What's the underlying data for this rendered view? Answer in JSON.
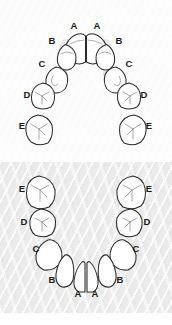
{
  "figure": {
    "panels": [
      {
        "id": "upper",
        "name": "maxillary-arch",
        "background_color": "#fdfdfd"
      },
      {
        "id": "lower",
        "name": "mandibular-arch",
        "background_color": "#ebebeb"
      }
    ],
    "tooth_outline_color": "#2a2a2a",
    "label_color": "#1b1b1b"
  },
  "upper_arch": {
    "labels": [
      {
        "text": "A",
        "x": 74,
        "y": 26
      },
      {
        "text": "A",
        "x": 97,
        "y": 26
      },
      {
        "text": "B",
        "x": 52,
        "y": 41
      },
      {
        "text": "B",
        "x": 119,
        "y": 41
      },
      {
        "text": "C",
        "x": 42,
        "y": 64
      },
      {
        "text": "C",
        "x": 129,
        "y": 64
      },
      {
        "text": "D",
        "x": 27,
        "y": 95
      },
      {
        "text": "D",
        "x": 144,
        "y": 95
      },
      {
        "text": "E",
        "x": 22,
        "y": 126
      },
      {
        "text": "E",
        "x": 149,
        "y": 126
      }
    ]
  },
  "lower_arch": {
    "labels": [
      {
        "text": "E",
        "x": 22,
        "y": 189
      },
      {
        "text": "E",
        "x": 149,
        "y": 189
      },
      {
        "text": "D",
        "x": 24,
        "y": 222
      },
      {
        "text": "D",
        "x": 147,
        "y": 222
      },
      {
        "text": "C",
        "x": 36,
        "y": 249
      },
      {
        "text": "C",
        "x": 136,
        "y": 249
      },
      {
        "text": "B",
        "x": 52,
        "y": 280
      },
      {
        "text": "B",
        "x": 120,
        "y": 280
      },
      {
        "text": "A",
        "x": 78,
        "y": 294
      },
      {
        "text": "A",
        "x": 95,
        "y": 294
      }
    ]
  },
  "legend": {
    "tooth_codes": [
      "A",
      "B",
      "C",
      "D",
      "E"
    ],
    "tooth_names": [
      "A - central incisor",
      "B - lateral incisor",
      "C - canine",
      "D - first molar",
      "E - second molar"
    ]
  }
}
